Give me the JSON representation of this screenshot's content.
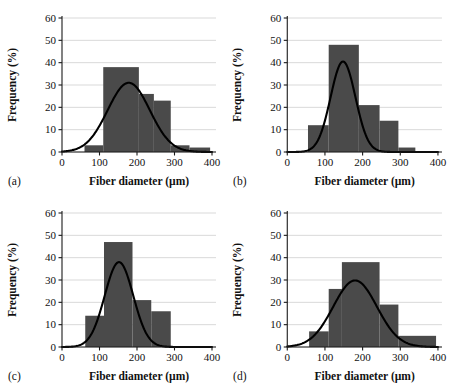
{
  "figure": {
    "background_color": "#ffffff",
    "bar_color": "#4a4a4a",
    "curve_color": "#000000",
    "grid_color": "#c9c9c9",
    "axis_color": "#1a1a1a"
  },
  "chart_data": [
    {
      "type": "bar",
      "panel_label": "(a)",
      "title": "",
      "xlabel": "Fiber diameter (µm)",
      "ylabel": "Frequency (%)",
      "xlim": [
        0,
        400
      ],
      "ylim": [
        0,
        60
      ],
      "xticks": [
        0,
        100,
        200,
        300,
        400
      ],
      "yticks": [
        0,
        10,
        20,
        30,
        40,
        50,
        60
      ],
      "grid": true,
      "legend": "none",
      "bins": [
        {
          "x0": 60,
          "x1": 110,
          "value": 3
        },
        {
          "x0": 110,
          "x1": 205,
          "value": 38
        },
        {
          "x0": 205,
          "x1": 245,
          "value": 26
        },
        {
          "x0": 245,
          "x1": 290,
          "value": 23
        },
        {
          "x0": 290,
          "x1": 340,
          "value": 3
        },
        {
          "x0": 340,
          "x1": 395,
          "value": 2
        }
      ],
      "fit_curve": {
        "type": "gaussian",
        "peak": 31,
        "mean": 178,
        "sigma": 56
      }
    },
    {
      "type": "bar",
      "panel_label": "(b)",
      "title": "",
      "xlabel": "Fiber diameter (µm)",
      "ylabel": "Frequency (%)",
      "xlim": [
        0,
        400
      ],
      "ylim": [
        0,
        60
      ],
      "xticks": [
        0,
        100,
        200,
        300,
        400
      ],
      "yticks": [
        0,
        10,
        20,
        30,
        40,
        50,
        60
      ],
      "grid": true,
      "legend": "none",
      "bins": [
        {
          "x0": 55,
          "x1": 110,
          "value": 12
        },
        {
          "x0": 110,
          "x1": 190,
          "value": 48
        },
        {
          "x0": 190,
          "x1": 245,
          "value": 21
        },
        {
          "x0": 245,
          "x1": 295,
          "value": 14
        },
        {
          "x0": 295,
          "x1": 340,
          "value": 2
        }
      ],
      "fit_curve": {
        "type": "gaussian",
        "peak": 40.5,
        "mean": 148,
        "sigma": 33
      }
    },
    {
      "type": "bar",
      "panel_label": "(c)",
      "title": "",
      "xlabel": "Fiber diameter (µm)",
      "ylabel": "Frequency (%)",
      "xlim": [
        0,
        400
      ],
      "ylim": [
        0,
        60
      ],
      "xticks": [
        0,
        100,
        200,
        300,
        400
      ],
      "yticks": [
        0,
        10,
        20,
        30,
        40,
        50,
        60
      ],
      "grid": true,
      "legend": "none",
      "bins": [
        {
          "x0": 62,
          "x1": 112,
          "value": 14
        },
        {
          "x0": 112,
          "x1": 188,
          "value": 47
        },
        {
          "x0": 188,
          "x1": 238,
          "value": 21
        },
        {
          "x0": 238,
          "x1": 290,
          "value": 16
        }
      ],
      "fit_curve": {
        "type": "gaussian",
        "peak": 38,
        "mean": 152,
        "sigma": 38
      }
    },
    {
      "type": "bar",
      "panel_label": "(d)",
      "title": "",
      "xlabel": "Fiber diameter (µm)",
      "ylabel": "Frequency (%)",
      "xlim": [
        0,
        400
      ],
      "ylim": [
        0,
        60
      ],
      "xticks": [
        0,
        100,
        200,
        300,
        400
      ],
      "yticks": [
        0,
        10,
        20,
        30,
        40,
        50,
        60
      ],
      "grid": true,
      "legend": "none",
      "bins": [
        {
          "x0": 58,
          "x1": 110,
          "value": 7
        },
        {
          "x0": 110,
          "x1": 145,
          "value": 26
        },
        {
          "x0": 145,
          "x1": 245,
          "value": 38
        },
        {
          "x0": 245,
          "x1": 295,
          "value": 19
        },
        {
          "x0": 295,
          "x1": 395,
          "value": 5
        }
      ],
      "fit_curve": {
        "type": "gaussian",
        "peak": 29.8,
        "mean": 180,
        "sigma": 58
      }
    }
  ]
}
